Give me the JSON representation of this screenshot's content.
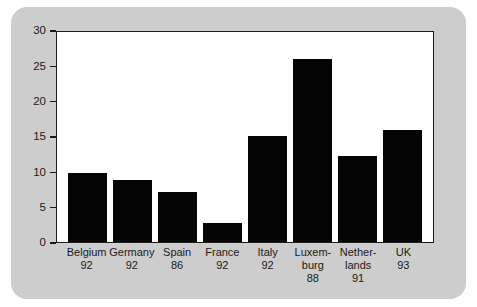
{
  "chart_data": {
    "type": "bar",
    "title": "",
    "subtitle": "",
    "xlabel": "",
    "ylabel": "",
    "ylim": [
      0,
      30
    ],
    "ytick_values": [
      0,
      5,
      10,
      15,
      20,
      25,
      30
    ],
    "ytick_labels": [
      "0",
      "5",
      "10",
      "15",
      "20",
      "25",
      "30"
    ],
    "grid": false,
    "legend": null,
    "bar_color": "#050505",
    "panel_color": "#cdcdcd",
    "plot_background": "#ffffff",
    "axis_color": "#1a1a1a",
    "categories": [
      "Belgium 92",
      "Germany 92",
      "Spain 86",
      "France 92",
      "Italy 92",
      "Luxem-burg 88",
      "Nether-lands 91",
      "UK 93"
    ],
    "values": [
      9.8,
      8.8,
      7.1,
      2.7,
      15.0,
      25.9,
      12.2,
      15.8
    ],
    "bars": [
      {
        "country": "Belgium",
        "label_lines": [
          "Belgium"
        ],
        "year": "92",
        "value": 9.8
      },
      {
        "country": "Germany",
        "label_lines": [
          "Germany"
        ],
        "year": "92",
        "value": 8.8
      },
      {
        "country": "Spain",
        "label_lines": [
          "Spain"
        ],
        "year": "86",
        "value": 7.1
      },
      {
        "country": "France",
        "label_lines": [
          "France"
        ],
        "year": "92",
        "value": 2.7
      },
      {
        "country": "Italy",
        "label_lines": [
          "Italy"
        ],
        "year": "92",
        "value": 15.0
      },
      {
        "country": "Luxembourg",
        "label_lines": [
          "Luxem-",
          "burg"
        ],
        "year": "88",
        "value": 25.9
      },
      {
        "country": "Netherlands",
        "label_lines": [
          "Nether-",
          "lands"
        ],
        "year": "91",
        "value": 12.2
      },
      {
        "country": "UK",
        "label_lines": [
          "UK"
        ],
        "year": "93",
        "value": 15.8
      }
    ]
  }
}
